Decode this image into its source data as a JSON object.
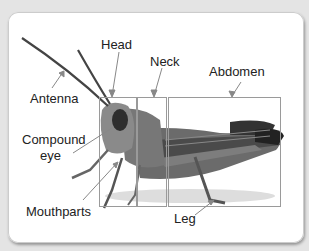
{
  "diagram": {
    "labels": {
      "head": "Head",
      "neck": "Neck",
      "abdomen": "Abdomen",
      "antenna": "Antenna",
      "compound_eye_1": "Compound",
      "compound_eye_2": "eye",
      "mouthparts": "Mouthparts",
      "leg": "Leg"
    },
    "regions": [
      {
        "name": "head",
        "x": 99,
        "y": 97,
        "w": 37,
        "h": 109
      },
      {
        "name": "neck",
        "x": 137,
        "y": 97,
        "w": 29,
        "h": 109
      },
      {
        "name": "abdomen",
        "x": 168,
        "y": 97,
        "w": 112,
        "h": 109
      }
    ],
    "colors": {
      "background": "#e4e4e4",
      "card": "#ffffff",
      "box": "#9a9a9a",
      "text": "#222222"
    }
  }
}
